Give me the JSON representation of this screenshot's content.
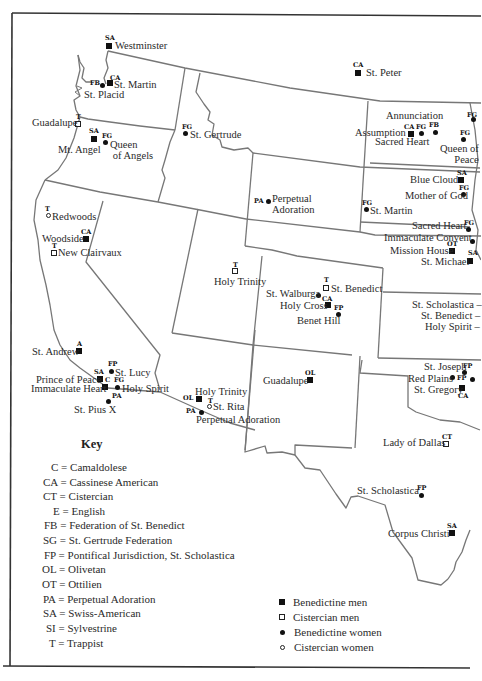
{
  "map": {
    "legend_markers": {
      "benedictine_men": "filled-square",
      "cistercian_men": "open-square",
      "benedictine_women": "filled-circle",
      "cistercian_women": "open-circle"
    },
    "sites": [
      {
        "name": "Westminster",
        "code": "SA",
        "type": "bm"
      },
      {
        "name": "St. Martin",
        "code": "CA",
        "type": "bm"
      },
      {
        "name": "St. Placid",
        "code": "FB",
        "type": "bw"
      },
      {
        "name": "Guadalupe",
        "code": "T",
        "type": "cm"
      },
      {
        "name": "Mt. Angel",
        "code": "SA",
        "type": "bm"
      },
      {
        "name": "Queen of Angels",
        "code": "FG",
        "type": "bw"
      },
      {
        "name": "St. Gertrude",
        "code": "FG",
        "type": "bw"
      },
      {
        "name": "St. Peter",
        "code": "CA",
        "type": "bm"
      },
      {
        "name": "Annunciation",
        "code": "FB",
        "type": "bw"
      },
      {
        "name": "Assumption",
        "code": "CA",
        "type": "bm"
      },
      {
        "name": "Sacred Heart",
        "code": "FG",
        "type": "bw"
      },
      {
        "name": "Queen of Peace",
        "code": "FG",
        "type": "bw"
      },
      {
        "name": "(unlabeled)",
        "code": "FG",
        "type": "bw"
      },
      {
        "name": "Blue Cloud",
        "code": "SA",
        "type": "bm"
      },
      {
        "name": "Mother of God",
        "code": "FG",
        "type": "bw"
      },
      {
        "name": "Perpetual Adoration",
        "code": "PA",
        "type": "bw"
      },
      {
        "name": "St. Martin",
        "code": "FG",
        "type": "bw"
      },
      {
        "name": "Sacred Heart",
        "code": "FG",
        "type": "bw"
      },
      {
        "name": "Immaculate Convent",
        "code": "",
        "type": "bw"
      },
      {
        "name": "Mission House",
        "code": "OT",
        "type": "bm"
      },
      {
        "name": "St. Michael",
        "code": "SA",
        "type": "bm"
      },
      {
        "name": "Redwoods",
        "code": "T",
        "type": "cw"
      },
      {
        "name": "Woodside",
        "code": "CA",
        "type": "bm"
      },
      {
        "name": "New Clairvaux",
        "code": "T",
        "type": "cm"
      },
      {
        "name": "Holy Trinity",
        "code": "T",
        "type": "cm"
      },
      {
        "name": "St. Benedict",
        "code": "T",
        "type": "cm"
      },
      {
        "name": "St. Walburga",
        "code": "",
        "type": "bw"
      },
      {
        "name": "Holy Cross",
        "code": "CA",
        "type": "bm"
      },
      {
        "name": "Benet Hill",
        "code": "FP",
        "type": "bw"
      },
      {
        "name": "St. Scholastica –",
        "code": "",
        "type": "text"
      },
      {
        "name": "St. Benedict –",
        "code": "",
        "type": "text"
      },
      {
        "name": "Holy Spirit –",
        "code": "",
        "type": "text"
      },
      {
        "name": "St. Andrew",
        "code": "A",
        "type": "bm"
      },
      {
        "name": "St. Lucy",
        "code": "FP",
        "type": "bw"
      },
      {
        "name": "Prince of Peace",
        "code": "SA",
        "type": "bm"
      },
      {
        "name": "Immaculate Heart",
        "code": "C",
        "type": "bm"
      },
      {
        "name": "Holy Spirit",
        "code": "FG",
        "type": "bw"
      },
      {
        "name": "St. Pius X",
        "code": "PA",
        "type": "bw"
      },
      {
        "name": "Holy Trinity",
        "code": "OL",
        "type": "bm"
      },
      {
        "name": "St. Rita",
        "code": "T",
        "type": "cw"
      },
      {
        "name": "Perpetual Adoration",
        "code": "PA",
        "type": "bw"
      },
      {
        "name": "Guadalupe",
        "code": "OL",
        "type": "bm"
      },
      {
        "name": "St. Joseph",
        "code": "FP",
        "type": "bw"
      },
      {
        "name": "Red Plains",
        "code": "FP",
        "type": "bw"
      },
      {
        "name": "St. Gregory",
        "code": "CA",
        "type": "bm"
      },
      {
        "name": "Lady of Dallas",
        "code": "CT",
        "type": "cm"
      },
      {
        "name": "St. Scholastica",
        "code": "FP",
        "type": "bw"
      },
      {
        "name": "Corpus Christi",
        "code": "SA",
        "type": "bm"
      }
    ]
  },
  "key": {
    "title": "Key",
    "items": [
      "C = Camaldolese",
      "CA = Cassinese American",
      "CT = Cistercian",
      "E = English",
      "FB = Federation of St. Benedict",
      "SG = St. Gertrude Federation",
      "FP = Pontifical Jurisdiction, St. Scholastica",
      "OL = Olivetan",
      "OT = Ottilien",
      "PA = Perpetual Adoration",
      "SA = Swiss-American",
      "SI = Sylvestrine",
      "T = Trappist"
    ]
  },
  "legend": {
    "items": [
      {
        "label": "Benedictine men",
        "icon": "filled-square"
      },
      {
        "label": "Cistercian men",
        "icon": "open-square"
      },
      {
        "label": "Benedictine women",
        "icon": "filled-circle"
      },
      {
        "label": "Cistercian women",
        "icon": "open-circle"
      }
    ]
  },
  "colors": {
    "state_border": "#6e6e6e",
    "frame": "#333333",
    "text": "#2a2a2a",
    "marker": "#111111"
  }
}
